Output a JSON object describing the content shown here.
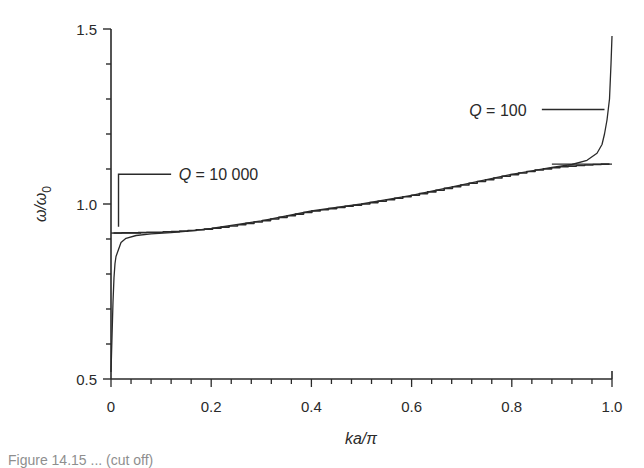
{
  "chart_data": {
    "type": "line",
    "title": "",
    "xlabel": "ka/π",
    "ylabel": "ω/ω0",
    "ylabel_main": "ω/ω",
    "ylabel_sub": "0",
    "xlim": [
      0,
      1.0
    ],
    "ylim": [
      0.5,
      1.5
    ],
    "grid": false,
    "legend": "none (inline annotations)",
    "x_ticks": [
      0,
      0.2,
      0.4,
      0.6,
      0.8,
      1.0
    ],
    "x_tick_labels": [
      "0",
      "0.2",
      "0.4",
      "0.6",
      "0.8",
      "1.0"
    ],
    "x_minor_step": 0.04,
    "y_ticks": [
      0.5,
      1.0,
      1.5
    ],
    "y_tick_labels": [
      "0.5",
      "1.0",
      "1.5"
    ],
    "y_minor_step": 0.1,
    "series": [
      {
        "name": "Q = 10 000",
        "style": "staircase",
        "x": [
          0.005,
          0.01,
          0.015,
          0.02,
          0.04,
          0.08,
          0.12,
          0.16,
          0.2,
          0.25,
          0.3,
          0.35,
          0.4,
          0.45,
          0.5,
          0.55,
          0.6,
          0.65,
          0.7,
          0.75,
          0.8,
          0.85,
          0.9,
          0.95,
          0.98,
          0.995
        ],
        "y": [
          0.917,
          0.917,
          0.917,
          0.918,
          0.918,
          0.919,
          0.921,
          0.925,
          0.93,
          0.94,
          0.952,
          0.966,
          0.98,
          0.99,
          1.0,
          1.012,
          1.025,
          1.04,
          1.055,
          1.07,
          1.085,
          1.098,
          1.107,
          1.112,
          1.114,
          1.114
        ]
      },
      {
        "name": "Q = 100",
        "style": "smooth",
        "x": [
          0.0,
          0.002,
          0.004,
          0.006,
          0.008,
          0.01,
          0.015,
          0.02,
          0.03,
          0.05,
          0.08,
          0.12,
          0.16,
          0.2,
          0.3,
          0.4,
          0.5,
          0.6,
          0.7,
          0.8,
          0.88,
          0.92,
          0.95,
          0.97,
          0.98,
          0.985,
          0.99,
          0.995,
          0.998,
          1.0
        ],
        "y": [
          0.52,
          0.62,
          0.72,
          0.79,
          0.83,
          0.85,
          0.87,
          0.89,
          0.902,
          0.91,
          0.915,
          0.918,
          0.923,
          0.93,
          0.952,
          0.98,
          1.0,
          1.025,
          1.055,
          1.085,
          1.105,
          1.113,
          1.125,
          1.145,
          1.17,
          1.2,
          1.24,
          1.3,
          1.4,
          1.48
        ]
      }
    ],
    "reference_lines": [
      {
        "name": "lower-band-edge",
        "y": 0.917,
        "x_from": 0.0,
        "x_to": 0.06
      },
      {
        "name": "upper-band-edge",
        "y": 1.114,
        "x_from": 0.88,
        "x_to": 1.0
      }
    ],
    "annotations": [
      {
        "text": "Q = 10 000",
        "x": 0.14,
        "y": 1.085,
        "leader": "L-shaped line from (0.015, 0.93) up to 1.085 then right to 0.12"
      },
      {
        "text": "Q = 100",
        "x": 0.72,
        "y": 1.265,
        "leader": "horizontal line from 0.86 to 0.985 at y = 1.27"
      }
    ]
  },
  "caption": {
    "text": "Figure 14.15 ... (cut off)"
  }
}
